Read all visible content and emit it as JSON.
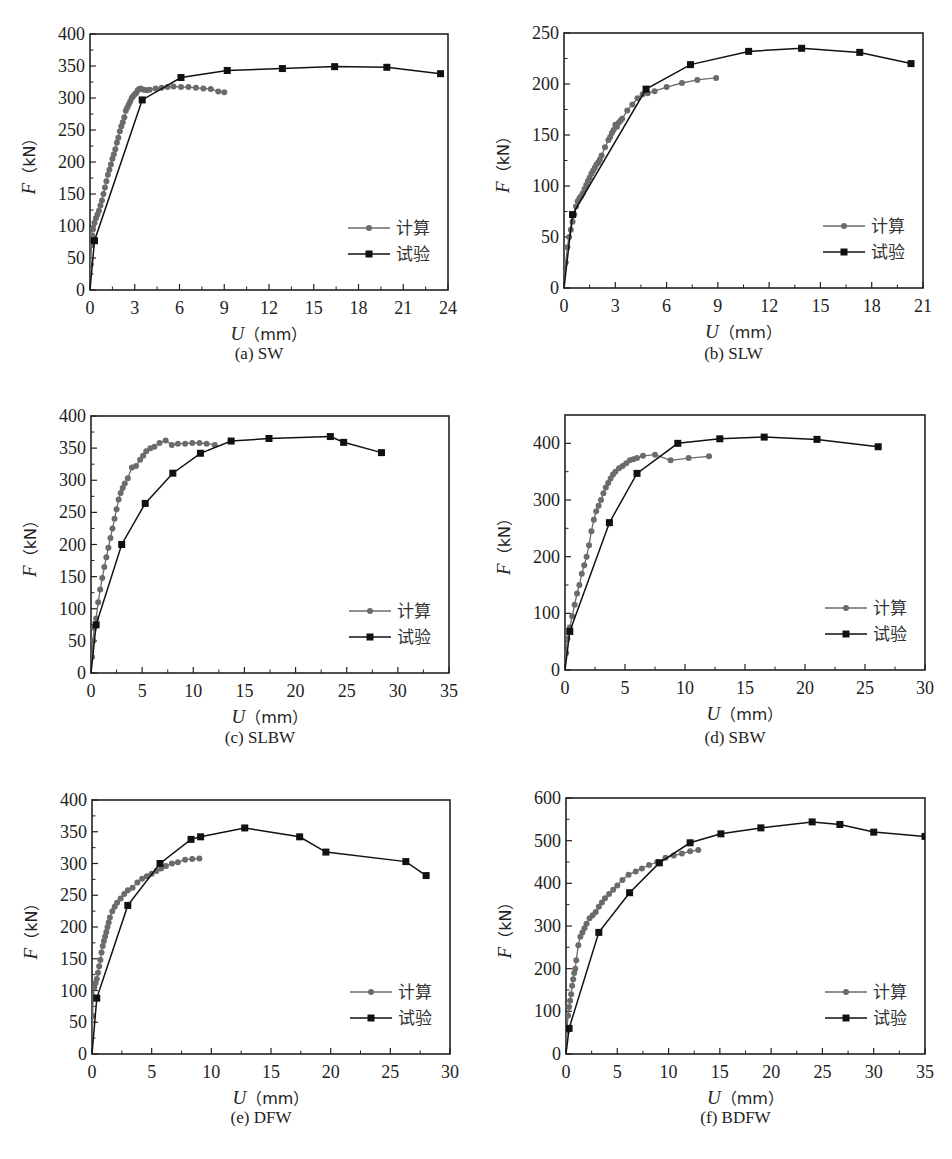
{
  "figure": {
    "legend_labels": [
      "计算",
      "试验"
    ],
    "series_colors": {
      "calc": "#6b6b6b",
      "test": "#111111"
    },
    "x_axis_label": "U（mm）",
    "y_axis_label": "F（kN）"
  },
  "chart_data": [
    {
      "id": "a",
      "type": "line",
      "caption": "(a) SW",
      "title": "(a) SW",
      "xlabel": "U (mm)",
      "ylabel": "F (kN)",
      "xlim": [
        0,
        24
      ],
      "ylim": [
        0,
        400
      ],
      "xticks": [
        0,
        3,
        6,
        9,
        12,
        15,
        18,
        21,
        24
      ],
      "yticks": [
        0,
        50,
        100,
        150,
        200,
        250,
        300,
        350,
        400
      ],
      "legend": [
        "计算",
        "试验"
      ],
      "legend_position": "lower right",
      "grid": false,
      "series": [
        {
          "name": "计算",
          "marker": "circle",
          "x": [
            0,
            0.05,
            0.1,
            0.15,
            0.2,
            0.3,
            0.4,
            0.5,
            0.6,
            0.7,
            0.8,
            0.9,
            1.0,
            1.1,
            1.2,
            1.3,
            1.4,
            1.5,
            1.6,
            1.7,
            1.8,
            1.9,
            2.0,
            2.1,
            2.2,
            2.3,
            2.4,
            2.5,
            2.6,
            2.7,
            2.8,
            2.9,
            3.0,
            3.1,
            3.2,
            3.3,
            3.4,
            3.6,
            3.8,
            4.0,
            4.4,
            4.8,
            5.2,
            5.6,
            6.1,
            6.6,
            7.1,
            7.6,
            8.1,
            8.6,
            9.0
          ],
          "y": [
            0,
            40,
            70,
            85,
            95,
            105,
            112,
            118,
            124,
            132,
            140,
            150,
            160,
            170,
            180,
            188,
            196,
            205,
            212,
            220,
            230,
            238,
            248,
            256,
            262,
            270,
            280,
            285,
            290,
            295,
            300,
            303,
            306,
            308,
            312,
            314,
            315,
            313,
            312,
            313,
            315,
            316,
            317,
            318,
            317,
            317,
            316,
            315,
            314,
            310,
            309
          ]
        },
        {
          "name": "试验",
          "marker": "square",
          "x": [
            0,
            0.3,
            3.5,
            6.1,
            9.2,
            12.9,
            16.4,
            19.9,
            23.5
          ],
          "y": [
            0,
            77,
            297,
            332,
            343,
            346,
            349,
            348,
            338
          ]
        }
      ]
    },
    {
      "id": "b",
      "type": "line",
      "caption": "(b) SLW",
      "title": "(b) SLW",
      "xlabel": "U (mm)",
      "ylabel": "F (kN)",
      "xlim": [
        0,
        21
      ],
      "ylim": [
        0,
        250
      ],
      "xticks": [
        0,
        3,
        6,
        9,
        12,
        15,
        18,
        21
      ],
      "yticks": [
        0,
        50,
        100,
        150,
        200,
        250
      ],
      "legend": [
        "计算",
        "试验"
      ],
      "legend_position": "lower right",
      "grid": false,
      "series": [
        {
          "name": "计算",
          "marker": "circle",
          "x": [
            0,
            0.1,
            0.2,
            0.3,
            0.4,
            0.5,
            0.6,
            0.7,
            0.8,
            0.9,
            1.0,
            1.1,
            1.2,
            1.3,
            1.4,
            1.5,
            1.6,
            1.7,
            1.8,
            1.9,
            2.0,
            2.1,
            2.2,
            2.4,
            2.6,
            2.7,
            2.8,
            2.9,
            3.0,
            3.1,
            3.2,
            3.3,
            3.4,
            3.7,
            4.0,
            4.3,
            4.6,
            4.9,
            5.3,
            6.0,
            6.9,
            7.8,
            8.9
          ],
          "y": [
            0,
            25,
            40,
            50,
            57,
            65,
            72,
            80,
            85,
            88,
            90,
            93,
            97,
            101,
            105,
            108,
            112,
            115,
            118,
            121,
            123,
            126,
            130,
            138,
            145,
            148,
            152,
            155,
            160,
            158,
            162,
            164,
            166,
            174,
            180,
            186,
            190,
            191,
            193,
            197,
            201,
            204,
            206
          ]
        },
        {
          "name": "试验",
          "marker": "square",
          "x": [
            0,
            0.5,
            4.8,
            7.4,
            10.8,
            13.9,
            17.3,
            20.3
          ],
          "y": [
            0,
            72,
            195,
            219,
            232,
            235,
            231,
            220
          ]
        }
      ]
    },
    {
      "id": "c",
      "type": "line",
      "caption": "(c) SLBW",
      "title": "(c) SLBW",
      "xlabel": "U (mm)",
      "ylabel": "F (kN)",
      "xlim": [
        0,
        35
      ],
      "ylim": [
        0,
        400
      ],
      "xticks": [
        0,
        5,
        10,
        15,
        20,
        25,
        30,
        35
      ],
      "yticks": [
        0,
        50,
        100,
        150,
        200,
        250,
        300,
        350,
        400
      ],
      "legend": [
        "计算",
        "试验"
      ],
      "legend_position": "lower right",
      "grid": false,
      "series": [
        {
          "name": "计算",
          "marker": "circle",
          "x": [
            0,
            0.1,
            0.2,
            0.3,
            0.5,
            0.7,
            0.9,
            1.1,
            1.3,
            1.5,
            1.7,
            1.9,
            2.1,
            2.3,
            2.5,
            2.7,
            2.9,
            3.1,
            3.3,
            3.6,
            4.0,
            4.4,
            4.8,
            5.1,
            5.4,
            5.8,
            6.2,
            6.7,
            7.3,
            7.9,
            8.5,
            9.2,
            9.9,
            10.6,
            11.3,
            12.1
          ],
          "y": [
            0,
            25,
            50,
            70,
            85,
            110,
            130,
            148,
            165,
            180,
            195,
            210,
            225,
            240,
            255,
            270,
            280,
            288,
            295,
            303,
            320,
            322,
            332,
            338,
            345,
            350,
            352,
            358,
            362,
            355,
            357,
            357,
            358,
            358,
            357,
            355
          ]
        },
        {
          "name": "试验",
          "marker": "square",
          "x": [
            0,
            0.5,
            3.0,
            5.3,
            8.0,
            10.7,
            13.7,
            17.4,
            23.4,
            24.7,
            28.4
          ],
          "y": [
            0,
            75,
            200,
            264,
            311,
            342,
            361,
            365,
            368,
            359,
            343
          ]
        }
      ]
    },
    {
      "id": "d",
      "type": "line",
      "caption": "(d) SBW",
      "title": "(d) SBW",
      "xlabel": "U (mm)",
      "ylabel": "F (kN)",
      "xlim": [
        0,
        30
      ],
      "ylim": [
        0,
        450
      ],
      "xticks": [
        0,
        5,
        10,
        15,
        20,
        25,
        30
      ],
      "yticks": [
        0,
        100,
        200,
        300,
        400
      ],
      "legend": [
        "计算",
        "试验"
      ],
      "legend_position": "lower right",
      "grid": false,
      "series": [
        {
          "name": "计算",
          "marker": "circle",
          "x": [
            0,
            0.1,
            0.2,
            0.4,
            0.6,
            0.8,
            1.0,
            1.2,
            1.4,
            1.6,
            1.8,
            2.0,
            2.2,
            2.4,
            2.6,
            2.8,
            3.0,
            3.2,
            3.4,
            3.6,
            3.8,
            4.0,
            4.2,
            4.5,
            4.8,
            5.1,
            5.4,
            5.7,
            6.0,
            6.5,
            7.5,
            8.8,
            10.3,
            12.0
          ],
          "y": [
            0,
            30,
            55,
            75,
            95,
            115,
            135,
            150,
            170,
            185,
            200,
            220,
            245,
            265,
            280,
            290,
            300,
            312,
            322,
            330,
            338,
            345,
            350,
            356,
            360,
            365,
            370,
            372,
            374,
            378,
            380,
            370,
            374,
            377
          ]
        },
        {
          "name": "试验",
          "marker": "square",
          "x": [
            0,
            0.4,
            3.7,
            6.0,
            9.4,
            12.9,
            16.6,
            21.0,
            26.1
          ],
          "y": [
            0,
            68,
            260,
            347,
            400,
            408,
            411,
            407,
            394
          ]
        }
      ]
    },
    {
      "id": "e",
      "type": "line",
      "caption": "(e) DFW",
      "title": "(e) DFW",
      "xlabel": "U (mm)",
      "ylabel": "F (kN)",
      "xlim": [
        0,
        30
      ],
      "ylim": [
        0,
        400
      ],
      "xticks": [
        0,
        5,
        10,
        15,
        20,
        25,
        30
      ],
      "yticks": [
        0,
        50,
        100,
        150,
        200,
        250,
        300,
        350,
        400
      ],
      "legend": [
        "计算",
        "试验"
      ],
      "legend_position": "lower right",
      "grid": false,
      "series": [
        {
          "name": "计算",
          "marker": "circle",
          "x": [
            0,
            0.05,
            0.1,
            0.2,
            0.3,
            0.4,
            0.5,
            0.6,
            0.7,
            0.8,
            0.9,
            1.0,
            1.1,
            1.2,
            1.3,
            1.4,
            1.5,
            1.7,
            1.9,
            2.1,
            2.4,
            2.7,
            3.0,
            3.4,
            3.8,
            4.2,
            4.6,
            5.0,
            5.4,
            5.8,
            6.2,
            6.7,
            7.2,
            7.8,
            8.4,
            9.0
          ],
          "y": [
            0,
            60,
            90,
            105,
            112,
            118,
            128,
            138,
            148,
            160,
            170,
            178,
            185,
            192,
            200,
            207,
            215,
            225,
            232,
            238,
            245,
            252,
            258,
            262,
            270,
            276,
            280,
            284,
            288,
            292,
            296,
            300,
            302,
            306,
            307,
            308
          ]
        },
        {
          "name": "试验",
          "marker": "square",
          "x": [
            0,
            0.4,
            3.0,
            5.7,
            8.3,
            9.1,
            12.8,
            17.4,
            19.6,
            26.3,
            28.0
          ],
          "y": [
            0,
            88,
            234,
            300,
            338,
            342,
            356,
            342,
            318,
            303,
            281
          ]
        }
      ]
    },
    {
      "id": "f",
      "type": "line",
      "caption": "(f) BDFW",
      "title": "(f) BDFW",
      "xlabel": "U (mm)",
      "ylabel": "F (kN)",
      "xlim": [
        0,
        35
      ],
      "ylim": [
        0,
        600
      ],
      "xticks": [
        0,
        5,
        10,
        15,
        20,
        25,
        30,
        35
      ],
      "yticks": [
        0,
        100,
        200,
        300,
        400,
        500,
        600
      ],
      "legend": [
        "计算",
        "试验"
      ],
      "legend_position": "lower right",
      "grid": false,
      "series": [
        {
          "name": "计算",
          "marker": "circle",
          "x": [
            0,
            0.1,
            0.2,
            0.3,
            0.4,
            0.5,
            0.6,
            0.7,
            0.8,
            0.9,
            1.0,
            1.2,
            1.4,
            1.6,
            1.8,
            2.0,
            2.3,
            2.6,
            2.9,
            3.2,
            3.5,
            3.8,
            4.2,
            4.6,
            5.0,
            5.5,
            6.1,
            6.8,
            7.4,
            8.1,
            8.9,
            9.7,
            10.5,
            11.3,
            12.1,
            12.9
          ],
          "y": [
            0,
            60,
            90,
            110,
            125,
            140,
            160,
            175,
            190,
            200,
            220,
            255,
            275,
            285,
            295,
            305,
            318,
            325,
            333,
            345,
            355,
            365,
            375,
            385,
            395,
            408,
            420,
            428,
            435,
            443,
            450,
            460,
            465,
            470,
            475,
            478
          ]
        },
        {
          "name": "试验",
          "marker": "square",
          "x": [
            0,
            0.3,
            3.2,
            6.2,
            9.1,
            12.1,
            15.1,
            19.0,
            24.0,
            26.7,
            30.0,
            35.0
          ],
          "y": [
            0,
            60,
            285,
            378,
            448,
            495,
            516,
            530,
            544,
            538,
            520,
            510
          ]
        }
      ]
    }
  ],
  "panels": [
    {
      "id": "a",
      "plot": {
        "left": 90,
        "top": 34,
        "right": 448,
        "bottom": 290
      },
      "caption_y": 356
    },
    {
      "id": "b",
      "plot": {
        "left": 564,
        "top": 33,
        "right": 923,
        "bottom": 288
      },
      "caption_y": 356
    },
    {
      "id": "c",
      "plot": {
        "left": 91,
        "top": 416,
        "right": 449,
        "bottom": 673
      },
      "caption_y": 740
    },
    {
      "id": "d",
      "plot": {
        "left": 565,
        "top": 415,
        "right": 925,
        "bottom": 670
      },
      "caption_y": 740
    },
    {
      "id": "e",
      "plot": {
        "left": 92,
        "top": 800,
        "right": 450,
        "bottom": 1054
      },
      "caption_y": 1120
    },
    {
      "id": "f",
      "plot": {
        "left": 566,
        "top": 798,
        "right": 925,
        "bottom": 1054
      },
      "caption_y": 1120
    }
  ]
}
